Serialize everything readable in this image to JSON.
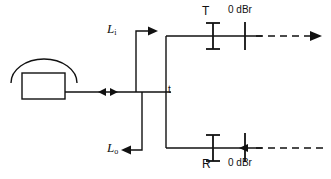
{
  "diagram": {
    "stroke_color": "#111111",
    "background_color": "#ffffff",
    "labels": {
      "line_in": {
        "base": "L",
        "subscript": "i"
      },
      "line_out": {
        "base": "L",
        "subscript": "o"
      },
      "junction": "t",
      "transmit": "T",
      "receive": "R",
      "level_point_top": "0 dBr",
      "level_point_bottom": "0 dBr"
    },
    "nodes": [
      {
        "name": "telephone-set",
        "label": "",
        "shape": "handset-over-box"
      },
      {
        "name": "two-wire-line",
        "label": "",
        "shape": "bidirectional-line"
      },
      {
        "name": "hybrid-junction",
        "label": "t",
        "shape": "tee-junction"
      },
      {
        "name": "transmit-branch",
        "label": "T",
        "shape": "i-beam"
      },
      {
        "name": "receive-branch",
        "label": "R",
        "shape": "i-beam"
      },
      {
        "name": "transmit-level-point",
        "label": "0 dBr",
        "shape": "tick"
      },
      {
        "name": "receive-level-point",
        "label": "0 dBr",
        "shape": "tick-with-arrow"
      }
    ]
  }
}
